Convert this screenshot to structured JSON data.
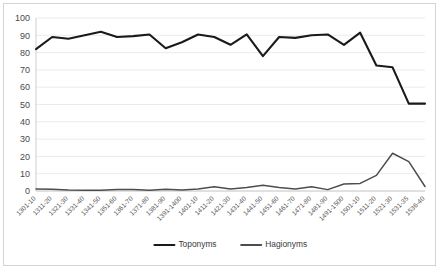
{
  "chart_data": {
    "type": "line",
    "title": "",
    "xlabel": "",
    "ylabel": "",
    "ylim": [
      0,
      100
    ],
    "ytick_values": [
      0,
      10,
      20,
      30,
      40,
      50,
      60,
      70,
      80,
      90,
      100
    ],
    "ytick_labels": [
      "0",
      "10",
      "20",
      "30",
      "40",
      "50",
      "60",
      "70",
      "80",
      "90",
      "100"
    ],
    "grid": true,
    "legend_position": "bottom",
    "categories": [
      "1301-10",
      "1311-20",
      "1321-30",
      "1331-40",
      "1341-50",
      "1351-60",
      "1361-70",
      "1371-80",
      "1381-90",
      "1391-1400",
      "1401-10",
      "1411-20",
      "1421-30",
      "1431-40",
      "1441-50",
      "1451-60",
      "1461-70",
      "1471-80",
      "1481-90",
      "1491-1500",
      "1501-10",
      "1511-20",
      "1521-30",
      "1531-35",
      "1536-40"
    ],
    "series": [
      {
        "name": "Toponyms",
        "color": "#1a1a1a",
        "width": 2.1,
        "values": [
          82,
          89,
          88,
          90,
          92,
          89,
          89.5,
          90.5,
          82.5,
          86,
          90.5,
          89,
          84.5,
          90.5,
          78,
          89,
          88.5,
          90,
          90.5,
          84.5,
          91.5,
          72.5,
          71.5,
          50.5,
          50.5
        ]
      },
      {
        "name": "Hagionyms",
        "color": "#4d4d4d",
        "width": 1.5,
        "values": [
          1.2,
          1,
          0.6,
          0.5,
          0.5,
          0.8,
          0.8,
          0.5,
          1,
          0.6,
          1.2,
          2.4,
          1.2,
          2,
          3.3,
          2,
          1.2,
          2.4,
          0.8,
          4,
          4.4,
          9,
          21.8,
          17,
          2.6
        ]
      }
    ],
    "legend": [
      {
        "label": "Toponyms",
        "color": "#1a1a1a"
      },
      {
        "label": "Hagionyms",
        "color": "#4d4d4d"
      }
    ]
  }
}
